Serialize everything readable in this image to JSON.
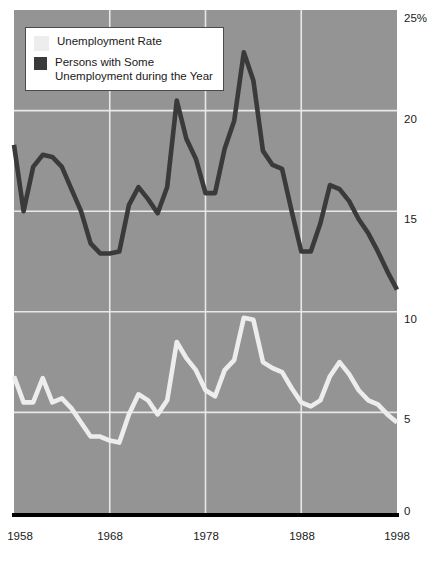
{
  "chart_data": {
    "type": "line",
    "title": "",
    "subtitle": "",
    "xlabel": "",
    "ylabel": "",
    "xlim": [
      1958,
      1998
    ],
    "ylim": [
      0,
      25
    ],
    "grid": true,
    "legend_position": "top-left",
    "plot_background_color": "#949494",
    "gridline_color": "#e8e8e8",
    "axis_color": "#000000",
    "y_ticks": [
      "0",
      "5",
      "10",
      "15",
      "20",
      "25%"
    ],
    "y_tick_values": [
      0,
      5,
      10,
      15,
      20,
      25
    ],
    "x_ticks": [
      "1958",
      "1968",
      "1978",
      "1988",
      "1998"
    ],
    "x_tick_values": [
      1958,
      1968,
      1978,
      1988,
      1998
    ],
    "x": [
      1958,
      1959,
      1960,
      1961,
      1962,
      1963,
      1964,
      1965,
      1966,
      1967,
      1968,
      1969,
      1970,
      1971,
      1972,
      1973,
      1974,
      1975,
      1976,
      1977,
      1978,
      1979,
      1980,
      1981,
      1982,
      1983,
      1984,
      1985,
      1986,
      1987,
      1988,
      1989,
      1990,
      1991,
      1992,
      1993,
      1994,
      1995,
      1996,
      1997,
      1998
    ],
    "series": [
      {
        "name": "Unemployment Rate",
        "color": "#ededed",
        "values": [
          6.8,
          5.5,
          5.5,
          6.7,
          5.5,
          5.7,
          5.2,
          4.5,
          3.8,
          3.8,
          3.6,
          3.5,
          4.9,
          5.9,
          5.6,
          4.9,
          5.6,
          8.5,
          7.7,
          7.1,
          6.1,
          5.8,
          7.1,
          7.6,
          9.7,
          9.6,
          7.5,
          7.2,
          7.0,
          6.2,
          5.5,
          5.3,
          5.6,
          6.8,
          7.5,
          6.9,
          6.1,
          5.6,
          5.4,
          4.9,
          4.5
        ]
      },
      {
        "name": "Persons with Some\nUnemployment during the Year",
        "color": "#3a3a3a",
        "values": [
          18.3,
          15.0,
          17.2,
          17.8,
          17.7,
          17.2,
          16.1,
          15.0,
          13.4,
          12.9,
          12.9,
          13.0,
          15.3,
          16.2,
          15.6,
          14.9,
          16.2,
          20.5,
          18.6,
          17.6,
          15.9,
          15.9,
          18.1,
          19.5,
          22.9,
          21.5,
          18.0,
          17.3,
          17.1,
          15.0,
          13.0,
          13.0,
          14.4,
          16.3,
          16.1,
          15.5,
          14.6,
          13.9,
          13.0,
          12.0,
          11.1
        ]
      }
    ]
  },
  "legend": {
    "items": [
      {
        "label": "Unemployment Rate",
        "color": "#ededed"
      },
      {
        "label": "Persons with Some\nUnemployment during the Year",
        "color": "#3a3a3a"
      }
    ]
  },
  "y_axis": {
    "labels": [
      "25%",
      "20",
      "15",
      "10",
      "5",
      "0"
    ]
  },
  "x_axis": {
    "labels": [
      "1958",
      "1968",
      "1978",
      "1988",
      "1998"
    ]
  }
}
